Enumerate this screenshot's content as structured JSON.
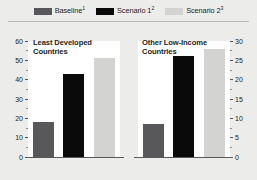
{
  "legend": {
    "items": [
      {
        "label": "Baseline",
        "note": "1",
        "color": "#58585a",
        "name": "baseline"
      },
      {
        "label": "Scenario 1",
        "note": "2",
        "color": "#0a0a0a",
        "name": "scenario-1"
      },
      {
        "label": "Scenario 2",
        "note": "3",
        "color": "#d3d3d1",
        "name": "scenario-2"
      }
    ]
  },
  "chart_data": {
    "type": "bar",
    "title": "",
    "panels": [
      {
        "id": "ldc",
        "title": "Least Developed Countries",
        "title_line1": "Least Developed",
        "title_line2": "Countries",
        "categories": [
          "Baseline",
          "Scenario 1",
          "Scenario 2"
        ],
        "values": [
          18,
          43,
          51
        ],
        "axis_side": "left",
        "ylim": [
          0,
          60
        ],
        "ytick_major": [
          0,
          10,
          20,
          30,
          40,
          50,
          60
        ],
        "ytick_minor": [
          5,
          15,
          25,
          35,
          45,
          55
        ],
        "xlabel": "",
        "ylabel": "",
        "grid": false
      },
      {
        "id": "olic",
        "title": "Other Low-Income Countries",
        "title_line1": "Other Low-Income",
        "title_line2": "Countries",
        "categories": [
          "Baseline",
          "Scenario 1",
          "Scenario 2"
        ],
        "values": [
          8.5,
          26,
          28
        ],
        "axis_side": "right",
        "ylim": [
          0,
          30
        ],
        "ytick_major": [
          0,
          5,
          10,
          15,
          20,
          25,
          30
        ],
        "ytick_minor": [
          2.5,
          7.5,
          12.5,
          17.5,
          22.5,
          27.5
        ],
        "xlabel": "",
        "ylabel": "",
        "grid": false
      }
    ],
    "series": [
      {
        "name": "Baseline",
        "color": "#58585a",
        "values": [
          18,
          8.5
        ]
      },
      {
        "name": "Scenario 1",
        "color": "#0a0a0a",
        "values": [
          43,
          26
        ]
      },
      {
        "name": "Scenario 2",
        "color": "#d3d3d1",
        "values": [
          51,
          28
        ]
      }
    ],
    "legend_position": "top"
  }
}
